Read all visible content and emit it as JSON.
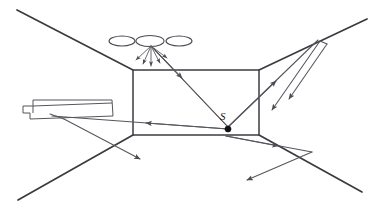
{
  "figure": {
    "source_label": "S",
    "background_color": "#ffffff",
    "line_color": "#3b3b42",
    "ray_color": "#55555d",
    "source_dot_color": "#111115"
  },
  "room": {
    "back_wall": {
      "x": 133,
      "y": 70,
      "width": 126,
      "height": 65
    },
    "perspective_lines": [
      {
        "name": "upper-left-corner-line",
        "from": [
          17,
          10
        ],
        "to": [
          133,
          70
        ]
      },
      {
        "name": "upper-right-corner-line",
        "from": [
          259,
          70
        ],
        "to": [
          367,
          19
        ]
      },
      {
        "name": "lower-left-corner-line",
        "from": [
          18,
          200
        ],
        "to": [
          133,
          135
        ]
      },
      {
        "name": "lower-right-corner-line",
        "from": [
          259,
          135
        ],
        "to": [
          362,
          192
        ]
      }
    ]
  },
  "ceiling_lights": {
    "count": 3,
    "positions": [
      {
        "cx": 122,
        "cy": 41,
        "rx": 13,
        "ry": 5
      },
      {
        "cx": 150,
        "cy": 41,
        "rx": 14,
        "ry": 5.5
      },
      {
        "cx": 179,
        "cy": 41,
        "rx": 13,
        "ry": 5
      }
    ],
    "emitting_light_index": 1
  },
  "light_fan": {
    "origin": [
      151,
      47
    ],
    "ray_count": 5,
    "endpoints": [
      [
        136,
        60
      ],
      [
        142,
        64
      ],
      [
        151,
        66
      ],
      [
        160,
        63
      ],
      [
        166,
        58
      ]
    ]
  },
  "furniture": {
    "name": "bed",
    "outline": "platform with headboard at left",
    "points": "27,106 33,106 33,100 110,100 113,116 30,119 30,113 23,113 23,106"
  },
  "rays": [
    {
      "name": "ray-light-to-source",
      "from": [
        153,
        49
      ],
      "to": [
        228,
        127
      ],
      "arrow_at": 0.33
    },
    {
      "name": "ray-source-to-ceiling-left",
      "from": [
        228,
        127
      ],
      "to": [
        153,
        49
      ],
      "arrow_at": 0.98
    },
    {
      "name": "ray-source-to-left-wall",
      "from": [
        228,
        127
      ],
      "to": [
        52,
        115
      ],
      "arrow_at": 0.47
    },
    {
      "name": "ray-source-to-upper-right",
      "from": [
        228,
        127
      ],
      "to": [
        318,
        40
      ],
      "arrow_at": 0.82
    },
    {
      "name": "ray-reflected-upper-right-down",
      "from": [
        316,
        38
      ],
      "to": [
        272,
        107
      ],
      "arrow_at": 0.96
    },
    {
      "name": "ray-reflected-upper-right-down-2",
      "from": [
        322,
        44
      ],
      "to": [
        288,
        100
      ],
      "arrow_at": 0.95
    },
    {
      "name": "ray-source-to-lower-right",
      "from": [
        228,
        137
      ],
      "to": [
        310,
        152
      ],
      "arrow_at": 0.55
    },
    {
      "name": "ray-reflected-lower-right-back",
      "from": [
        310,
        152
      ],
      "to": [
        248,
        180
      ],
      "arrow_at": 0.95
    },
    {
      "name": "ray-left-wall-down-right",
      "from": [
        68,
        122
      ],
      "to": [
        140,
        159
      ],
      "arrow_at": 0.96
    },
    {
      "name": "ray-bed-to-floor",
      "from": [
        60,
        117
      ],
      "to": [
        118,
        125
      ],
      "arrow_at": 0.6
    }
  ],
  "source": {
    "label": "S",
    "dot": [
      228,
      129
    ],
    "label_position": [
      222,
      119
    ]
  }
}
